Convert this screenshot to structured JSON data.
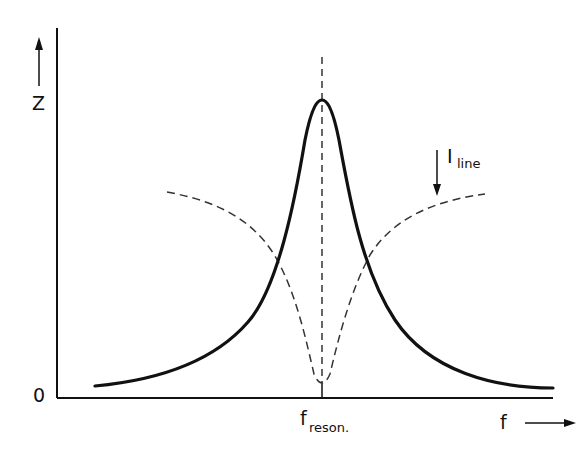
{
  "diagram": {
    "title": "",
    "y_axis": {
      "label": "Z",
      "origin_label": "0"
    },
    "x_axis": {
      "label": "f",
      "marker_label_main": "f",
      "marker_label_sub": "reson."
    },
    "curves": [
      {
        "name": "Z",
        "style": "solid-thick",
        "shape": "resonance peak (impedance max at f_reson.)"
      },
      {
        "name": "I_line",
        "style": "dashed",
        "shape": "inverse dip (line current min at f_reson.)"
      }
    ],
    "annotations": {
      "i_line_main": "I",
      "i_line_sub": "line",
      "i_line_arrow": "down"
    },
    "colors": {
      "ink": "#111111",
      "dashed": "#333333",
      "background": "#ffffff"
    }
  }
}
